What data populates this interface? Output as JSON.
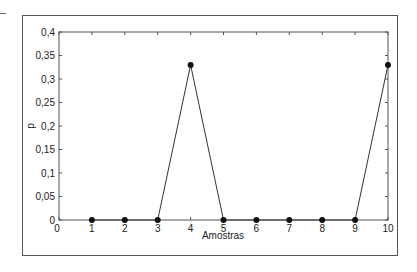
{
  "chart_data": {
    "type": "line",
    "title": "",
    "xlabel": "Amostras",
    "ylabel": "p",
    "x": [
      1,
      2,
      3,
      4,
      5,
      6,
      7,
      8,
      9,
      10
    ],
    "series": [
      {
        "name": "p",
        "values": [
          0,
          0,
          0,
          0.33,
          0,
          0,
          0,
          0,
          0,
          0.33
        ]
      }
    ],
    "xlim": [
      0,
      10
    ],
    "ylim": [
      0,
      0.4
    ],
    "x_ticks": [
      "0",
      "1",
      "2",
      "3",
      "4",
      "5",
      "6",
      "7",
      "8",
      "9",
      "10"
    ],
    "y_ticks": [
      "0",
      "0,05",
      "0,1",
      "0,15",
      "0,2",
      "0,25",
      "0,3",
      "0,35",
      "0,4"
    ],
    "grid": false,
    "legend": null,
    "markers": "filled-circle",
    "line_color": "#333333",
    "marker_color": "#111111"
  }
}
